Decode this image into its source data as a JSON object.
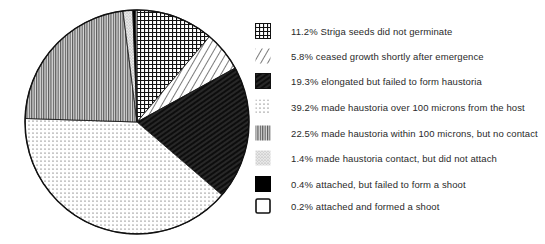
{
  "chart_data": {
    "type": "pie",
    "title": "",
    "start_angle": "12 o'clock",
    "direction": "clockwise",
    "legend_position": "right",
    "slices": [
      {
        "label": "11.2% Striga seeds did not germinate",
        "value": 11.2,
        "pattern": "crosshatch"
      },
      {
        "label": "5.8% ceased growth shortly after emergence",
        "value": 5.8,
        "pattern": "diagonal"
      },
      {
        "label": "19.3% elongated but failed to form haustoria",
        "value": 19.3,
        "pattern": "dark-hatch"
      },
      {
        "label": "39.2% made haustoria over 100 microns from the host",
        "value": 39.2,
        "pattern": "dots"
      },
      {
        "label": "22.5% made haustoria within 100 microns, but no contact",
        "value": 22.5,
        "pattern": "vertical"
      },
      {
        "label": "1.4% made haustoria contact, but did not attach",
        "value": 1.4,
        "pattern": "stipple"
      },
      {
        "label": "0.4% attached, but failed to form a shoot",
        "value": 0.4,
        "pattern": "solid-black"
      },
      {
        "label": "0.2% attached and formed a shoot",
        "value": 0.2,
        "pattern": "white"
      }
    ]
  },
  "colors": {
    "ink": "#111111",
    "paper": "#ffffff"
  }
}
